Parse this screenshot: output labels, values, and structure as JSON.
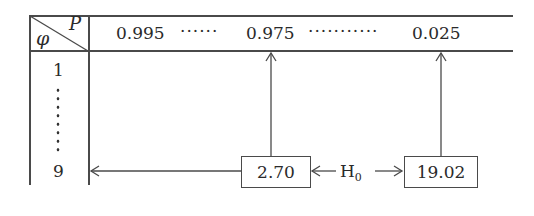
{
  "header": {
    "corner_row_symbol": "φ",
    "corner_col_symbol": "P",
    "p_values": [
      "0.995",
      "0.975",
      "0.025"
    ],
    "ellipsis_short": "······",
    "ellipsis_long": "···········"
  },
  "rows": {
    "first": "1",
    "last": "9",
    "vertical_ellipsis": "⋮"
  },
  "critical_values": {
    "left_box": "2.70",
    "right_box": "19.02"
  },
  "hypothesis": {
    "label": "H",
    "subscript": "0"
  }
}
